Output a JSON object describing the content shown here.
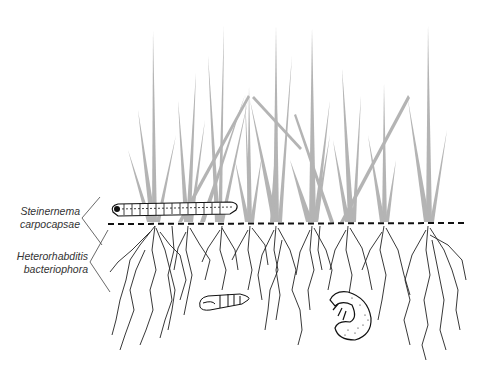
{
  "diagram": {
    "type": "illustration",
    "labels": [
      {
        "id": "steinernema",
        "line1": "Steinernema",
        "line2": "carpocapsae",
        "zone": "surface / thatch"
      },
      {
        "id": "heterorhabditis",
        "line1": "Heterorhabditis",
        "line2": "bacteriophora",
        "zone": "soil / root zone"
      }
    ],
    "elements": {
      "grass": {
        "color": "#b4b4b4",
        "description": "grass blades above soil line"
      },
      "soil_line": {
        "style": "dashed",
        "color": "#111111"
      },
      "roots": {
        "color": "#222222"
      },
      "caterpillar": {
        "description": "cutworm larva on soil surface"
      },
      "pupa": {
        "description": "insect pupa in soil"
      },
      "grub": {
        "description": "white grub (C-shaped larva) in soil"
      }
    }
  }
}
